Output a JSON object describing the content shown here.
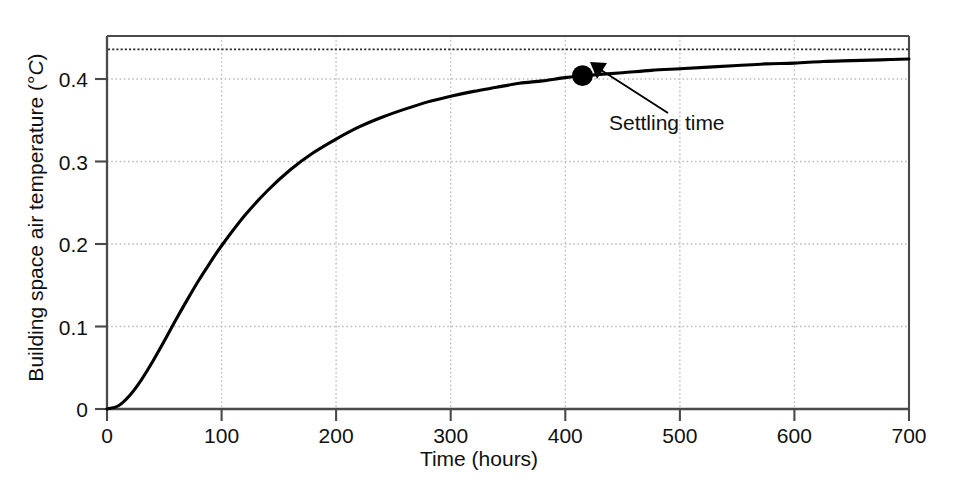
{
  "chart_data": {
    "type": "line",
    "title": "",
    "xlabel": "Time (hours)",
    "ylabel_text": "Building space air temperature (",
    "ylabel_degree": "°",
    "ylabel_unit": "C",
    "ylabel_close": ")",
    "ylabel_full": "Building space air temperature (°C)",
    "xlim": [
      0,
      700
    ],
    "ylim": [
      0,
      0.4615
    ],
    "xticks": [
      0,
      100,
      200,
      300,
      400,
      500,
      600,
      700
    ],
    "xtick_labels": [
      "0",
      "100",
      "200",
      "300",
      "400",
      "500",
      "600",
      "700"
    ],
    "yticks": [
      0,
      0.1,
      0.2,
      0.3,
      0.4
    ],
    "ytick_labels": [
      "0",
      "0.1",
      "0.2",
      "0.3",
      "0.4"
    ],
    "grid": true,
    "grid_style": "dotted",
    "legend": "none",
    "line_color": "#000000",
    "line_width": 3,
    "asymptote": {
      "value": 0.445,
      "style": "dotted",
      "label": ""
    },
    "series": [
      {
        "name": "Building space air temperature step response",
        "x": [
          0,
          10,
          20,
          30,
          40,
          50,
          60,
          70,
          80,
          90,
          100,
          120,
          140,
          160,
          180,
          200,
          220,
          240,
          260,
          280,
          300,
          320,
          340,
          360,
          380,
          400,
          415,
          430,
          450,
          475,
          500,
          525,
          550,
          575,
          600,
          625,
          650,
          675,
          700
        ],
        "y": [
          0,
          0.004,
          0.017,
          0.036,
          0.059,
          0.084,
          0.11,
          0.135,
          0.159,
          0.181,
          0.202,
          0.239,
          0.27,
          0.296,
          0.317,
          0.334,
          0.349,
          0.361,
          0.371,
          0.38,
          0.387,
          0.393,
          0.398,
          0.403,
          0.406,
          0.41,
          0.412,
          0.414,
          0.416,
          0.419,
          0.421,
          0.423,
          0.425,
          0.427,
          0.428,
          0.43,
          0.431,
          0.432,
          0.433
        ]
      }
    ],
    "annotations": [
      {
        "name": "settling-time",
        "label": "Settling time",
        "point_x": 415,
        "point_y": 0.4125,
        "marker": "filled-circle",
        "marker_size": 11,
        "arrow_tip_x": 430,
        "arrow_tip_y": 0.3935,
        "label_x": 530,
        "label_y": 0.318
      }
    ]
  },
  "annotation": {
    "settling_time_label": "Settling time"
  },
  "axes": {
    "x_title": "Time (hours)",
    "y_title_prefix": "Building space air temperature (°",
    "y_title_unit": "C",
    "y_title_suffix": ")"
  },
  "ticks": {
    "x": [
      "0",
      "100",
      "200",
      "300",
      "400",
      "500",
      "600",
      "700"
    ],
    "y": [
      "0",
      "0.1",
      "0.2",
      "0.3",
      "0.4"
    ]
  },
  "colors": {
    "line": "#000000",
    "axis": "#3a3a3a",
    "grid": "#b9b9b9",
    "text": "#111111",
    "background": "#ffffff"
  }
}
